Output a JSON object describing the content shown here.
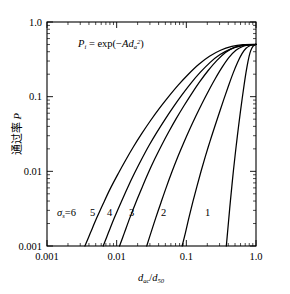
{
  "chart_data": {
    "type": "line",
    "title": "",
    "xlabel": "d_ac/d_50",
    "ylabel": "通过率 P",
    "xscale": "log",
    "yscale": "log",
    "xlim": [
      0.001,
      1.0
    ],
    "ylim": [
      0.001,
      1.0
    ],
    "grid": false,
    "legend": "inline-curve-labels",
    "annotation": "P_i = exp(-A d_a^2)",
    "x_ticklabels": [
      "0.001",
      "0.01",
      "0.1",
      "1.0"
    ],
    "x_tickvalues": [
      0.001,
      0.01,
      0.1,
      1.0
    ],
    "y_ticklabels": [
      "0.001",
      "0.01",
      "0.1",
      "1.0"
    ],
    "y_tickvalues": [
      0.001,
      0.01,
      0.1,
      1.0
    ],
    "converge_point": {
      "x": 1.0,
      "y": 0.5
    },
    "series": [
      {
        "name": "6",
        "label": "σₛ=6",
        "sigma": 6,
        "points": [
          [
            0.0035,
            0.001
          ],
          [
            0.0042,
            0.0015
          ],
          [
            0.0052,
            0.0024
          ],
          [
            0.0065,
            0.0038
          ],
          [
            0.0082,
            0.006
          ],
          [
            0.0105,
            0.0093
          ],
          [
            0.0135,
            0.0142
          ],
          [
            0.0175,
            0.0215
          ],
          [
            0.023,
            0.0322
          ],
          [
            0.0305,
            0.0476
          ],
          [
            0.041,
            0.0697
          ],
          [
            0.056,
            0.101
          ],
          [
            0.077,
            0.144
          ],
          [
            0.107,
            0.2
          ],
          [
            0.15,
            0.27
          ],
          [
            0.215,
            0.348
          ],
          [
            0.31,
            0.419
          ],
          [
            0.45,
            0.47
          ],
          [
            0.65,
            0.496
          ],
          [
            1.0,
            0.5
          ]
        ]
      },
      {
        "name": "5",
        "label": "5",
        "sigma": 5,
        "points": [
          [
            0.0064,
            0.001
          ],
          [
            0.0076,
            0.0015
          ],
          [
            0.0093,
            0.0024
          ],
          [
            0.0115,
            0.0038
          ],
          [
            0.0143,
            0.006
          ],
          [
            0.018,
            0.0094
          ],
          [
            0.0228,
            0.0145
          ],
          [
            0.029,
            0.022
          ],
          [
            0.0375,
            0.033
          ],
          [
            0.049,
            0.049
          ],
          [
            0.0645,
            0.072
          ],
          [
            0.086,
            0.105
          ],
          [
            0.116,
            0.151
          ],
          [
            0.158,
            0.211
          ],
          [
            0.218,
            0.286
          ],
          [
            0.305,
            0.366
          ],
          [
            0.43,
            0.434
          ],
          [
            0.61,
            0.478
          ],
          [
            0.8,
            0.494
          ],
          [
            1.0,
            0.5
          ]
        ]
      },
      {
        "name": "4",
        "label": "4",
        "sigma": 4,
        "points": [
          [
            0.011,
            0.001
          ],
          [
            0.0129,
            0.0015
          ],
          [
            0.0155,
            0.0024
          ],
          [
            0.0188,
            0.0038
          ],
          [
            0.023,
            0.006
          ],
          [
            0.0284,
            0.0095
          ],
          [
            0.0353,
            0.0147
          ],
          [
            0.0442,
            0.0224
          ],
          [
            0.056,
            0.0339
          ],
          [
            0.0715,
            0.0508
          ],
          [
            0.092,
            0.075
          ],
          [
            0.1195,
            0.11
          ],
          [
            0.156,
            0.159
          ],
          [
            0.206,
            0.224
          ],
          [
            0.273,
            0.304
          ],
          [
            0.365,
            0.39
          ],
          [
            0.49,
            0.457
          ],
          [
            0.66,
            0.488
          ],
          [
            0.84,
            0.497
          ],
          [
            1.0,
            0.5
          ]
        ]
      },
      {
        "name": "3",
        "label": "3",
        "sigma": 3,
        "points": [
          [
            0.027,
            0.001
          ],
          [
            0.031,
            0.0015
          ],
          [
            0.0365,
            0.0024
          ],
          [
            0.0432,
            0.0038
          ],
          [
            0.0515,
            0.0061
          ],
          [
            0.0618,
            0.0097
          ],
          [
            0.0745,
            0.0152
          ],
          [
            0.0905,
            0.0234
          ],
          [
            0.1105,
            0.0357
          ],
          [
            0.136,
            0.0541
          ],
          [
            0.168,
            0.081
          ],
          [
            0.209,
            0.12
          ],
          [
            0.261,
            0.175
          ],
          [
            0.327,
            0.248
          ],
          [
            0.41,
            0.335
          ],
          [
            0.515,
            0.418
          ],
          [
            0.645,
            0.47
          ],
          [
            0.8,
            0.492
          ],
          [
            0.9,
            0.497
          ],
          [
            1.0,
            0.5
          ]
        ]
      },
      {
        "name": "2",
        "label": "2",
        "sigma": 2,
        "points": [
          [
            0.087,
            0.001
          ],
          [
            0.097,
            0.0015
          ],
          [
            0.109,
            0.0024
          ],
          [
            0.124,
            0.0039
          ],
          [
            0.142,
            0.0063
          ],
          [
            0.163,
            0.0101
          ],
          [
            0.188,
            0.016
          ],
          [
            0.218,
            0.025
          ],
          [
            0.254,
            0.039
          ],
          [
            0.296,
            0.06
          ],
          [
            0.345,
            0.092
          ],
          [
            0.402,
            0.139
          ],
          [
            0.468,
            0.205
          ],
          [
            0.545,
            0.289
          ],
          [
            0.63,
            0.377
          ],
          [
            0.72,
            0.445
          ],
          [
            0.815,
            0.48
          ],
          [
            0.9,
            0.494
          ],
          [
            0.96,
            0.498
          ],
          [
            1.0,
            0.5
          ]
        ]
      },
      {
        "name": "1",
        "label": "1",
        "sigma": 1,
        "points": [
          [
            0.375,
            0.001
          ],
          [
            0.39,
            0.0015
          ],
          [
            0.408,
            0.0024
          ],
          [
            0.428,
            0.0039
          ],
          [
            0.45,
            0.0063
          ],
          [
            0.474,
            0.0102
          ],
          [
            0.501,
            0.0163
          ],
          [
            0.53,
            0.0256
          ],
          [
            0.562,
            0.0402
          ],
          [
            0.597,
            0.0625
          ],
          [
            0.635,
            0.096
          ],
          [
            0.676,
            0.145
          ],
          [
            0.72,
            0.213
          ],
          [
            0.768,
            0.298
          ],
          [
            0.818,
            0.383
          ],
          [
            0.87,
            0.445
          ],
          [
            0.92,
            0.48
          ],
          [
            0.96,
            0.495
          ],
          [
            0.985,
            0.499
          ],
          [
            1.0,
            0.5
          ]
        ]
      }
    ]
  },
  "annotation": {
    "p": "P",
    "p_sub": "i",
    "eq": "= exp(−",
    "a": "A",
    "d": "d",
    "d_sub": "a",
    "d_sup": "2",
    "close": ")"
  },
  "axes": {
    "x_title_d": "d",
    "x_title_d_sub": "ac",
    "x_title_slash": "/",
    "x_title_d2": "d",
    "x_title_d2_sub": "50",
    "y_title_cn": "通过率",
    "y_title_p": "P"
  },
  "curve_labels": {
    "sigma_label_sigma": "σ",
    "sigma_label_sub": "s",
    "sigma_label_eq": "=6",
    "l5": "5",
    "l4": "4",
    "l3": "3",
    "l2": "2",
    "l1": "1"
  },
  "colors": {
    "ink": "#000000",
    "background": "#ffffff"
  }
}
